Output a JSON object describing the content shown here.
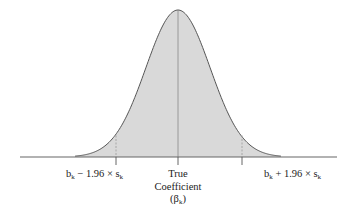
{
  "chart_data": {
    "type": "area",
    "title": "",
    "xlabel": "",
    "ylabel": "",
    "grid": false,
    "legend": null,
    "distribution": "normal",
    "mean_label": "True Coefficient (βk)",
    "critical_value": 1.96,
    "markers": [
      {
        "position": -1.96,
        "label": "bk − 1.96 × sk"
      },
      {
        "position": 0,
        "label": "True Coefficient (βk)"
      },
      {
        "position": 1.96,
        "label": "bk + 1.96 × sk"
      }
    ],
    "x_range_sd": [
      -3.2,
      3.2
    ],
    "fill_color": "#d9d9d9",
    "line_color": "#555555"
  },
  "labels": {
    "left": {
      "base": "b",
      "sub1": "k",
      "mid": " − 1.96 × s",
      "sub2": "k"
    },
    "right": {
      "base": "b",
      "sub1": "k",
      "mid": " + 1.96 × s",
      "sub2": "k"
    },
    "center": {
      "line1": "True",
      "line2": "Coefficient",
      "line3_open": "(β",
      "line3_sub": "k",
      "line3_close": ")"
    }
  }
}
